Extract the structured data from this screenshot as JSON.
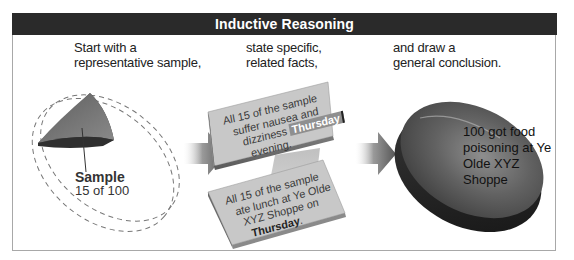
{
  "header": {
    "title": "Inductive Reasoning"
  },
  "steps": [
    {
      "caption_lines": [
        "Start with a",
        "representative  sample,"
      ]
    },
    {
      "caption_lines": [
        "state  specific,",
        "related facts,"
      ]
    },
    {
      "caption_lines": [
        "and draw a",
        "general conclusion."
      ]
    }
  ],
  "sample": {
    "label": "Sample",
    "count": "15 of 100"
  },
  "facts": [
    {
      "lines": [
        "All 15 of the sample",
        "suffer nausea and"
      ],
      "line3_prefix": "dizziness ",
      "line3_highlight": "Thursday",
      "line4": "evening."
    },
    {
      "lines": [
        "All 15 of the sample",
        "ate lunch at Ye Olde",
        "XYZ Shoppe on"
      ],
      "line4_bold": "Thursday",
      "line4_suffix": "."
    }
  ],
  "conclusion": {
    "lines": [
      "100 got food",
      "poisoning at Ye",
      "Olde XYZ",
      "Shoppe"
    ]
  },
  "colors": {
    "header_bg": "#2a2a2a",
    "frame_border": "#a8a8a8",
    "card": "#c9c9c9",
    "disc": "#5a5a5a"
  }
}
